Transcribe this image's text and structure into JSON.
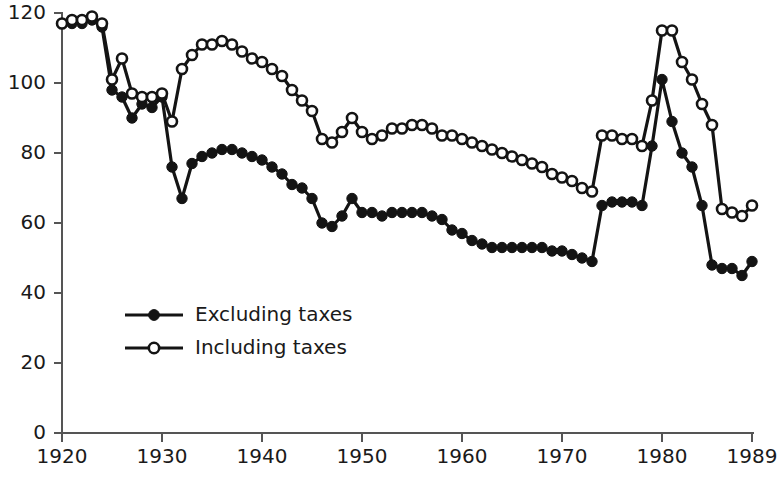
{
  "chart_data": {
    "type": "line",
    "title": "",
    "xlabel": "",
    "ylabel": "",
    "xlim": [
      1920,
      1989
    ],
    "ylim": [
      0,
      120
    ],
    "grid": false,
    "legend_position": "inside-lower-left",
    "xticks": [
      1920,
      1930,
      1940,
      1950,
      1960,
      1970,
      1980,
      1989
    ],
    "xtick_labels": [
      "1920",
      "1930",
      "1940",
      "1950",
      "1960",
      "1970",
      "1980",
      "1989"
    ],
    "yticks": [
      0,
      20,
      40,
      60,
      80,
      100,
      120
    ],
    "ytick_labels": [
      "0",
      "20",
      "40",
      "60",
      "80",
      "100",
      "120"
    ],
    "x": [
      1920,
      1921,
      1922,
      1923,
      1924,
      1925,
      1926,
      1927,
      1928,
      1929,
      1930,
      1931,
      1932,
      1933,
      1934,
      1935,
      1936,
      1937,
      1938,
      1939,
      1940,
      1941,
      1942,
      1943,
      1944,
      1945,
      1946,
      1947,
      1948,
      1949,
      1950,
      1951,
      1952,
      1953,
      1954,
      1955,
      1956,
      1957,
      1958,
      1959,
      1960,
      1961,
      1962,
      1963,
      1964,
      1965,
      1966,
      1967,
      1968,
      1969,
      1970,
      1971,
      1972,
      1973,
      1974,
      1975,
      1976,
      1977,
      1978,
      1979,
      1980,
      1981,
      1982,
      1983,
      1984,
      1985,
      1986,
      1987,
      1988,
      1989
    ],
    "series": [
      {
        "name": "Excluding taxes",
        "marker": "filled-circle",
        "color": "#141414",
        "values": [
          117,
          117,
          117,
          118,
          116,
          98,
          96,
          90,
          94,
          93,
          96,
          76,
          67,
          77,
          79,
          80,
          81,
          81,
          80,
          79,
          78,
          76,
          74,
          71,
          70,
          67,
          60,
          59,
          62,
          67,
          63,
          63,
          62,
          63,
          63,
          63,
          63,
          62,
          61,
          58,
          57,
          55,
          54,
          53,
          53,
          53,
          53,
          53,
          53,
          52,
          52,
          51,
          50,
          49,
          65,
          66,
          66,
          66,
          65,
          82,
          101,
          89,
          80,
          76,
          65,
          48,
          47,
          47,
          45,
          49
        ]
      },
      {
        "name": "Including taxes",
        "marker": "open-circle",
        "color": "#141414",
        "values": [
          117,
          118,
          118,
          119,
          117,
          101,
          107,
          97,
          96,
          96,
          97,
          89,
          104,
          108,
          111,
          111,
          112,
          111,
          109,
          107,
          106,
          104,
          102,
          98,
          95,
          92,
          84,
          83,
          86,
          90,
          86,
          84,
          85,
          87,
          87,
          88,
          88,
          87,
          85,
          85,
          84,
          83,
          82,
          81,
          80,
          79,
          78,
          77,
          76,
          74,
          73,
          72,
          70,
          69,
          85,
          85,
          84,
          84,
          82,
          95,
          115,
          115,
          106,
          101,
          94,
          88,
          64,
          63,
          62,
          65
        ]
      }
    ]
  },
  "legend": {
    "items": [
      {
        "label": "Excluding taxes",
        "marker": "filled-circle"
      },
      {
        "label": "Including taxes",
        "marker": "open-circle"
      }
    ]
  },
  "caption": {
    "text": ""
  },
  "colors": {
    "ink": "#141414",
    "axis": "#555555",
    "text": "#1a1a1a"
  }
}
